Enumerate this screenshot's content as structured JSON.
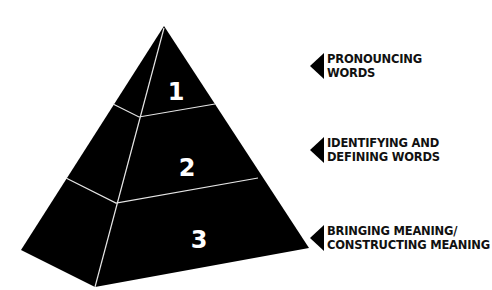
{
  "diagram": {
    "type": "pyramid",
    "tiers": [
      {
        "number": "1",
        "label_lines": [
          "PRONOUNCING",
          "WORDS"
        ]
      },
      {
        "number": "2",
        "label_lines": [
          "IDENTIFYING AND",
          "DEFINING WORDS"
        ]
      },
      {
        "number": "3",
        "label_lines": [
          "BRINGING MEANING/",
          "CONSTRUCTING MEANING"
        ]
      }
    ],
    "colors": {
      "pyramid_fill": "#000000",
      "edge_lines": "#e6e6e6",
      "tier_numbers": "#ffffff",
      "label_text": "#111111",
      "background": "#ffffff"
    }
  }
}
